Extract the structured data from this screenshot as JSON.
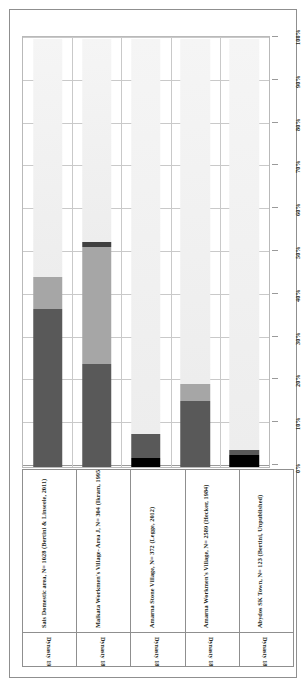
{
  "chart_data": {
    "type": "bar",
    "subtype": "stacked-100-percent",
    "title": "",
    "xlabel": "",
    "ylabel": "",
    "ylim": [
      0,
      100
    ],
    "y_unit": "%",
    "grid": true,
    "legend_position": "left-rotated",
    "ytick_labels": [
      "100%",
      "90%",
      "80%",
      "70%",
      "60%",
      "50%",
      "40%",
      "30%",
      "20%",
      "10%",
      "0%"
    ],
    "ytick_values": [
      100,
      90,
      80,
      70,
      60,
      50,
      40,
      30,
      20,
      10,
      0
    ],
    "categories": [
      "Sais Domestic area, N= 1028 (Bertini & Linseele, 2011)",
      "Malkata Workmen's Village- Area J, N= 304 (Ikram, 1995)",
      "Amarna Stone Village, N= 372 (Legge, 2012)",
      "Amarna Workmen's Village, N= 2589 (Hecker, 1984)",
      "Abydos SK Town, N= 123 (Bertini, Unpublished)"
    ],
    "category_subtitles": [
      "Dynasty 19-20",
      "Dynasty 18",
      "Dynasty 18",
      "Dynasty 18",
      "Dynasty 18"
    ],
    "series": [
      {
        "name": "Collecting of molluscs",
        "color": "#000000",
        "values": [
          0,
          0,
          2.0,
          0,
          2.8
        ]
      },
      {
        "name": "Fishing",
        "color": "#595959",
        "values": [
          37.0,
          24.0,
          5.8,
          15.5,
          1.2
        ]
      },
      {
        "name": "Fowling",
        "color": "#a6a6a6",
        "values": [
          7.5,
          27.5,
          0,
          3.8,
          0
        ]
      },
      {
        "name": "Hunting",
        "color": "#404040",
        "values": [
          0,
          1.0,
          0,
          0,
          0
        ]
      },
      {
        "name": "Stock Keeping",
        "color": "#f2f2f2",
        "values": [
          55.5,
          47.5,
          92.2,
          80.7,
          96.0
        ]
      }
    ]
  },
  "legend": {
    "items": [
      {
        "label": "Collecting of molluscs",
        "color": "#000000"
      },
      {
        "label": "Fishing",
        "color": "#595959"
      },
      {
        "label": "Fowling",
        "color": "#a6a6a6"
      },
      {
        "label": "Hunting",
        "color": "#404040"
      },
      {
        "label": "Stock Keeping",
        "color": "#f2f2f2"
      }
    ]
  }
}
